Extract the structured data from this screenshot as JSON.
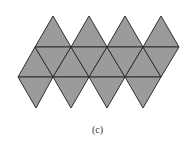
{
  "figure": {
    "caption": "(c)",
    "colors": {
      "fill": "#9b9b9b",
      "edge": "#2f2f2f",
      "background": "#ffffff"
    },
    "rows": {
      "top_apex_y": 16,
      "upper_line_y": 47,
      "lower_line_y": 77,
      "bottom_apex_y": 108
    },
    "top_apex_x": [
      53,
      89,
      125,
      161
    ],
    "upper_line_x": [
      35,
      71,
      107,
      143,
      179
    ],
    "lower_line_x": [
      18,
      53,
      89,
      125,
      161
    ],
    "bottom_apex_x": [
      36,
      71,
      107,
      143
    ],
    "triangle_count": 20
  }
}
